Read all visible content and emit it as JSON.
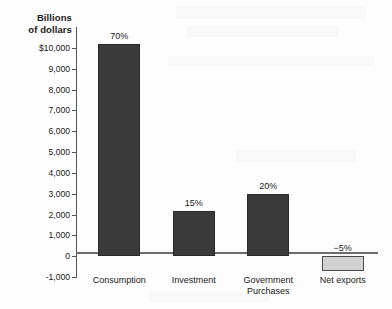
{
  "chart_data": {
    "type": "bar",
    "title": "",
    "xlabel": "",
    "ylabel": "Billions\nof dollars",
    "ylabel_line1": "Billions",
    "ylabel_line2": "of dollars",
    "categories": [
      "Consumption",
      "Investment",
      "Government Purchases",
      "Net exports"
    ],
    "values": [
      10200,
      2150,
      3000,
      -700
    ],
    "data_labels": [
      "70%",
      "15%",
      "20%",
      "−5%"
    ],
    "ylim": [
      -1000,
      11000
    ],
    "yticks": [
      -1000,
      0,
      1000,
      2000,
      3000,
      4000,
      5000,
      6000,
      7000,
      8000,
      9000,
      10000
    ],
    "ytick_labels": [
      "-1,000",
      "0",
      "1,000",
      "2,000",
      "3,000",
      "4,000",
      "5,000",
      "6,000",
      "7,000",
      "8,000",
      "9,000",
      "$10,000"
    ],
    "grid": false,
    "legend": "none",
    "series": [
      {
        "name": "Components of GDP",
        "values": [
          10200,
          2150,
          3000,
          -700
        ]
      }
    ],
    "bar_colors": [
      "#3a3a3a",
      "#3a3a3a",
      "#3a3a3a",
      "#d2d2d2"
    ],
    "accent_color": "#3a3a3a",
    "negative_color": "#d2d2d2",
    "axis_color": "#555555"
  }
}
